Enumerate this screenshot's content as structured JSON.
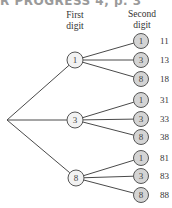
{
  "header_fragment": "R PROGRESS 4, p. 3",
  "columns": {
    "first_digit": "First\ndigit",
    "second_digit": "Second\ndigit"
  },
  "colors": {
    "line": "#4a4a4a",
    "first_node_fill": "#f2f2f2",
    "leaf_node_fill": "#d4d4d4",
    "node_stroke": "#555555"
  },
  "tree": {
    "root": {
      "x": 7,
      "y": 120
    },
    "branches": [
      {
        "digit": "1",
        "x": 75,
        "y": 60,
        "leaves": [
          {
            "digit": "1",
            "y": 41,
            "value": "11"
          },
          {
            "digit": "3",
            "y": 60,
            "value": "13"
          },
          {
            "digit": "8",
            "y": 79,
            "value": "18"
          }
        ]
      },
      {
        "digit": "3",
        "x": 75,
        "y": 120,
        "leaves": [
          {
            "digit": "1",
            "y": 100,
            "value": "31"
          },
          {
            "digit": "3",
            "y": 119,
            "value": "33"
          },
          {
            "digit": "8",
            "y": 137,
            "value": "38"
          }
        ]
      },
      {
        "digit": "8",
        "x": 76,
        "y": 178,
        "leaves": [
          {
            "digit": "1",
            "y": 158,
            "value": "81"
          },
          {
            "digit": "3",
            "y": 176,
            "value": "83"
          },
          {
            "digit": "8",
            "y": 195,
            "value": "88"
          }
        ]
      }
    ],
    "leaf_x": 141,
    "value_x": 160
  }
}
